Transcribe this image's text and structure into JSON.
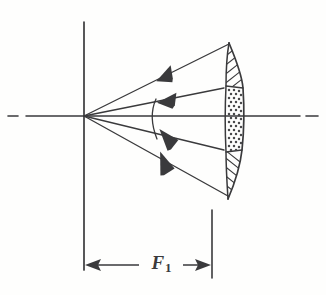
{
  "figure": {
    "name": "parabolic-reflector-focal-distance",
    "background_color": "#fefefd",
    "ink_color": "#3a3a3c"
  },
  "dimension": {
    "symbol": "F",
    "subscript": "1",
    "full_label": "F1",
    "description": "focal distance from feed vertex to reflector aperture plane"
  },
  "axis": {
    "name": "centerline-axis",
    "style": "dash-dot centerline",
    "y": 116,
    "left_dash": {
      "x1": 8,
      "x2": 18
    },
    "main_line": {
      "x1": 26,
      "x2": 300
    },
    "right_dash": {
      "x1": 306,
      "x2": 318
    }
  },
  "vertical_reference": {
    "name": "feed-vertex-line",
    "x": 84,
    "y_top": 22,
    "y_bottom": 270
  },
  "vertex": {
    "x": 84,
    "y": 116,
    "label": "feed phase center"
  },
  "rays": [
    {
      "name": "ray-outer-upper",
      "x1": 84,
      "y1": 116,
      "x2": 229,
      "y2": 44,
      "arrow_t": 0.53
    },
    {
      "name": "ray-inner-upper",
      "x1": 84,
      "y1": 116,
      "x2": 224,
      "y2": 88,
      "arrow_t": 0.55
    },
    {
      "name": "ray-inner-lower",
      "x1": 84,
      "y1": 116,
      "x2": 224,
      "y2": 150,
      "arrow_t": 0.55
    },
    {
      "name": "ray-outer-lower",
      "x1": 84,
      "y1": 116,
      "x2": 228,
      "y2": 196,
      "arrow_t": 0.53
    }
  ],
  "beam_arc": {
    "name": "subtended-angle-arc",
    "description": "arc spanning the inner beam angle at the feed",
    "radius": 74
  },
  "reflector": {
    "name": "parabolic-dish",
    "top": {
      "x": 229,
      "y": 43
    },
    "bottom": {
      "x": 228,
      "y": 199
    },
    "front_bulge_x": 243,
    "back_edge_x": 226,
    "thickness": 11,
    "regions": [
      {
        "name": "hatched-upper-rim",
        "pattern": "diagonal-hatch",
        "y_from": 43,
        "y_to": 86
      },
      {
        "name": "stippled-illuminated-center",
        "pattern": "stipple-dots",
        "y_from": 86,
        "y_to": 152
      },
      {
        "name": "hatched-lower-rim",
        "pattern": "diagonal-hatch",
        "y_from": 152,
        "y_to": 199
      }
    ]
  },
  "dimension_line": {
    "name": "focal-distance-dimension",
    "y": 265,
    "x_start": 84,
    "x_end": 212,
    "left_arrow": "left",
    "right_arrow": "right",
    "extension_line_right": {
      "x": 212,
      "y_top": 210,
      "y_bottom": 278
    }
  }
}
